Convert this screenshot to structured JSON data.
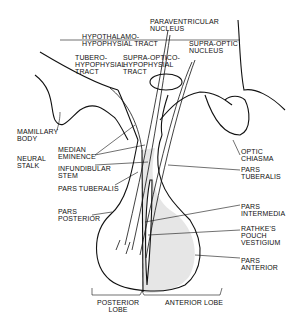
{
  "diagram": {
    "labels": {
      "hypothalamo": "HYPOTHALAMO-\nHYPOPHYSIAL TRACT",
      "paraventricular": "PARAVENTRICULAR\nNUCLEUS",
      "supraoptic_nucleus": "SUPRA-OPTIC\nNUCLEUS",
      "tubero": "TUBERO-\nHYPOPHYSIAL\nTRACT",
      "supraoptico": "SUPRA-OPTICO-\nHYPOPHYSIAL\nTRACT",
      "mamillary": "MAMILLARY\nBODY",
      "neural_stalk": "NEURAL\nSTALK",
      "median_eminence": "MEDIAN\nEMINENCE",
      "infundibular": "INFUNDIBULAR\nSTEM",
      "pars_tuberalis_left": "PARS TUBERALIS",
      "optic_chiasma": "OPTIC\nCHIASMA",
      "pars_tuberalis_right": "PARS\nTUBERALIS",
      "pars_posterior": "PARS\nPOSTERIOR",
      "pars_intermedia": "PARS\nINTERMEDIA",
      "rathkes": "RATHKE'S\nPOUCH\nVESTIGIUM",
      "pars_anterior": "PARS\nANTERIOR",
      "posterior_lobe": "POSTERIOR\nLOBE",
      "anterior_lobe": "ANTERIOR LOBE"
    },
    "colors": {
      "ink": "#111111",
      "fill": "#e6e6e6",
      "background": "#ffffff"
    }
  }
}
